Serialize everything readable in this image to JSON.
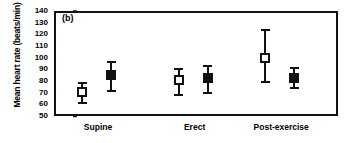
{
  "chart_data": {
    "type": "scatter",
    "title": "",
    "panel_label": "(b)",
    "xlabel": "",
    "ylabel": "Mean heart rate (beats/min)",
    "categories": [
      "Supine",
      "Erect",
      "Post-exercise"
    ],
    "ylim": [
      50,
      140
    ],
    "yticks": [
      50,
      60,
      70,
      80,
      90,
      100,
      110,
      120,
      130,
      140
    ],
    "grid": false,
    "legend": "none",
    "series": [
      {
        "name": "open-square",
        "marker": "open-square",
        "color": "#111111",
        "values": [
          71,
          81,
          100
        ],
        "err_low": [
          60,
          67,
          78
        ],
        "err_high": [
          79,
          91,
          125
        ]
      },
      {
        "name": "filled-square",
        "marker": "filled-square",
        "color": "#111111",
        "values": [
          85,
          83,
          83
        ],
        "err_low": [
          71,
          69,
          73
        ],
        "err_high": [
          97,
          94,
          92
        ]
      }
    ]
  }
}
